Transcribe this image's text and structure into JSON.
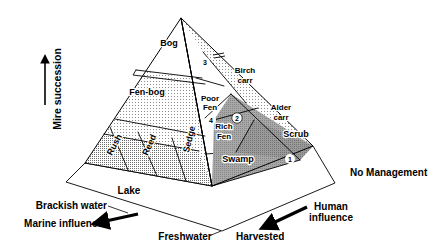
{
  "figure": {
    "type": "diagram",
    "colors": {
      "stroke": "#000000",
      "background": "#ffffff",
      "face_left_upper_fill": "#e8e8e8",
      "face_left_lower_fill": "#c9c9c9",
      "face_right_fill": "#9a9a9a",
      "face_right_upper_fill": "#ededed",
      "base_fill": "#ffffff",
      "marker_fill": "#ffffff"
    }
  },
  "axes": {
    "vertical": {
      "label": "Mire succession",
      "arrow": "up-arrow-icon"
    },
    "left_base": {
      "label_top": "Brackish water",
      "label_bottom": "Marine influence",
      "arrow": "left-arrow-icon"
    },
    "right_base": {
      "label_top": "Human",
      "label_bottom": "influence",
      "arrow": "down-left-arrow-icon"
    },
    "front_left_edge_label": "Lake",
    "front_right_edge_label": "Freshwater",
    "bottom_right_label": "Harvested",
    "far_right_label": "No Management"
  },
  "zones": [
    {
      "id": "bog",
      "label": "Bog",
      "face": "apex"
    },
    {
      "id": "fen-bog",
      "label": "Fen-bog",
      "face": "left-upper"
    },
    {
      "id": "poor-fen",
      "label_line1": "Poor",
      "label_line2": "Fen",
      "face": "left-upper"
    },
    {
      "id": "birch-carr",
      "label_line1": "Birch",
      "label_line2": "carr",
      "face": "right-upper"
    },
    {
      "id": "alder-carr",
      "label_line1": "Alder",
      "label_line2": "carr",
      "face": "right"
    },
    {
      "id": "scrub",
      "label": "Scrub",
      "face": "right"
    },
    {
      "id": "rich-fen",
      "label_line1": "Rich",
      "label_line2": "Fen",
      "face": "left-lower"
    },
    {
      "id": "swamp",
      "label": "Swamp",
      "face": "left-lower"
    },
    {
      "id": "rush",
      "label": "Rush",
      "face": "left-lower",
      "rotated": true
    },
    {
      "id": "reed",
      "label": "Reed",
      "face": "left-lower",
      "rotated": true
    },
    {
      "id": "sedge",
      "label": "Sedge",
      "face": "left-lower",
      "rotated": true
    }
  ],
  "markers": [
    {
      "id": "marker-1",
      "label": "1"
    },
    {
      "id": "marker-2",
      "label": "2"
    },
    {
      "id": "marker-3",
      "label": "3"
    },
    {
      "id": "marker-4",
      "label": "4"
    }
  ]
}
